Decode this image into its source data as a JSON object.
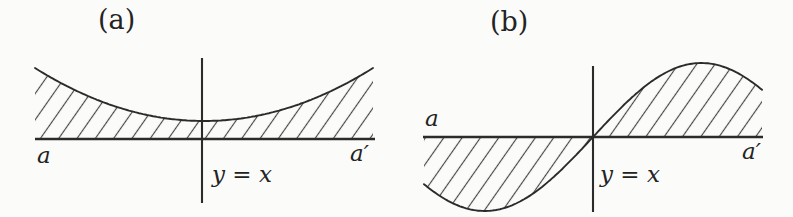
{
  "figure": {
    "colors": {
      "line": "#2b2b2b",
      "hatch": "#454545",
      "background": "#fbfbfa"
    },
    "panels": [
      {
        "caption": "(a)",
        "left_axis_label": "a",
        "right_axis_label": "a′",
        "vline_label": "y = x",
        "curve": "upward parabola above axis, shaded between curve and axis"
      },
      {
        "caption": "(b)",
        "left_axis_label": "a",
        "right_axis_label": "a′",
        "vline_label": "y = x",
        "curve": "odd sine-like curve through origin, shaded between curve and axis"
      }
    ],
    "geometry": [
      {
        "axis": {
          "x1": 35,
          "x2": 375,
          "y": 139
        },
        "vline": {
          "x": 202,
          "y1": 58,
          "y2": 203
        },
        "curve": {
          "type": "parabola",
          "x1": 35,
          "x2": 373,
          "vertexX": 204,
          "vertexY": 121,
          "endY": 68,
          "halfW": 169
        }
      },
      {
        "axis": {
          "x1": 423,
          "x2": 763,
          "y": 137
        },
        "vline": {
          "x": 593,
          "y1": 66,
          "y2": 212
        },
        "curve": {
          "type": "sine",
          "x1": 424,
          "x2": 762,
          "cx": 593,
          "cy": 137,
          "amp": 74,
          "k": 0.0145
        }
      }
    ],
    "hatch": {
      "angle_deg": -55,
      "spacing": 15,
      "stroke_width": 1.15
    }
  }
}
